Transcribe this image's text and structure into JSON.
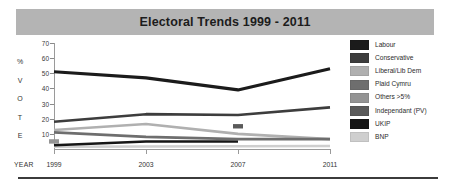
{
  "title": "Electoral Trends 1999 - 2011",
  "axis": {
    "y_word_letters": [
      "%",
      "V",
      "O",
      "T",
      "E"
    ],
    "y_ticks": [
      "70",
      "60",
      "50",
      "40",
      "30",
      "20",
      "10"
    ],
    "x_word": "YEAR",
    "x_labels": [
      "1999",
      "2003",
      "2007",
      "2011"
    ]
  },
  "legend": {
    "items": [
      {
        "label": "Labour",
        "color": "#1b1b1b"
      },
      {
        "label": "Conservative",
        "color": "#3d3d3d"
      },
      {
        "label": "Liberal/Lib Dem",
        "color": "#b0b0b0"
      },
      {
        "label": "Plaid Cymru",
        "color": "#6e6e6e"
      },
      {
        "label": "Others >5%",
        "color": "#949494"
      },
      {
        "label": "Independant (PV)",
        "color": "#5a5a5a"
      },
      {
        "label": "UKIP",
        "color": "#161616"
      },
      {
        "label": "BNP",
        "color": "#cfcfcf"
      }
    ]
  },
  "chart_data": {
    "type": "line",
    "title": "Electoral Trends 1999 - 2011",
    "xlabel": "YEAR",
    "ylabel": "% VOTE",
    "x": [
      "1999",
      "2003",
      "2007",
      "2011"
    ],
    "ylim": [
      0,
      70
    ],
    "yticks": [
      10,
      20,
      30,
      40,
      50,
      60,
      70
    ],
    "grid": false,
    "legend_position": "right",
    "series": [
      {
        "name": "Labour",
        "color": "#1b1b1b",
        "values": [
          51,
          47,
          39,
          53
        ]
      },
      {
        "name": "Conservative",
        "color": "#3d3d3d",
        "values": [
          18,
          23,
          22.5,
          27.5
        ]
      },
      {
        "name": "Liberal/Lib Dem",
        "color": "#b0b0b0",
        "values": [
          12.5,
          16.5,
          10,
          6.5
        ]
      },
      {
        "name": "Plaid Cymru",
        "color": "#6e6e6e",
        "values": [
          11,
          8,
          6.5,
          6.5
        ]
      },
      {
        "name": "Others >5%",
        "color": "#949494",
        "values": [
          5,
          null,
          null,
          null
        ]
      },
      {
        "name": "Independant (PV)",
        "color": "#5a5a5a",
        "values": [
          null,
          null,
          15,
          null
        ]
      },
      {
        "name": "UKIP",
        "color": "#161616",
        "values": [
          2.5,
          5,
          5,
          null
        ]
      },
      {
        "name": "BNP",
        "color": "#cfcfcf",
        "values": [
          1.5,
          null,
          null,
          2
        ]
      }
    ]
  }
}
